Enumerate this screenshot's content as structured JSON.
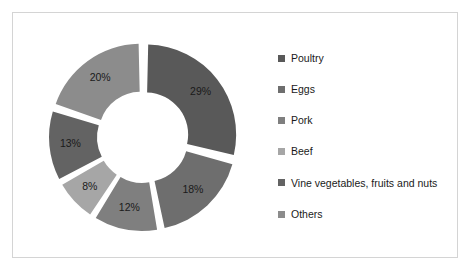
{
  "chart_data": {
    "type": "pie",
    "variant": "doughnut-exploded",
    "title": "",
    "subtitle": "",
    "xlabel": "",
    "ylabel": "",
    "grid": false,
    "legend_position": "right",
    "labels_show_percent": true,
    "categories": [
      "Poultry",
      "Eggs",
      "Pork",
      "Beef",
      "Vine vegetables, fruits and nuts",
      "Others"
    ],
    "values": [
      29,
      18,
      12,
      8,
      13,
      20
    ],
    "value_labels": [
      "29%",
      "18%",
      "12%",
      "8%",
      "13%",
      "20%"
    ],
    "colors": [
      "#595959",
      "#6e6e6e",
      "#7f7f7f",
      "#a6a6a6",
      "#636363",
      "#8c8c8c"
    ],
    "slices": [
      {
        "label": "Poultry",
        "value": 29,
        "display": "29%",
        "color": "#595959"
      },
      {
        "label": "Eggs",
        "value": 18,
        "display": "18%",
        "color": "#6e6e6e"
      },
      {
        "label": "Pork",
        "value": 12,
        "display": "12%",
        "color": "#7f7f7f"
      },
      {
        "label": "Beef",
        "value": 8,
        "display": "8%",
        "color": "#a6a6a6"
      },
      {
        "label": "Vine vegetables, fruits and nuts",
        "value": 13,
        "display": "13%",
        "color": "#636363"
      },
      {
        "label": "Others",
        "value": 20,
        "display": "20%",
        "color": "#8c8c8c"
      }
    ]
  },
  "legend": {
    "items": [
      {
        "label": "Poultry",
        "color": "#595959"
      },
      {
        "label": "Eggs",
        "color": "#6e6e6e"
      },
      {
        "label": "Pork",
        "color": "#7f7f7f"
      },
      {
        "label": "Beef",
        "color": "#a6a6a6"
      },
      {
        "label": "Vine vegetables, fruits and nuts",
        "color": "#636363"
      },
      {
        "label": "Others",
        "color": "#8c8c8c"
      }
    ]
  },
  "frame": {
    "border_color": "#d4d4d4",
    "background": "#ffffff"
  }
}
